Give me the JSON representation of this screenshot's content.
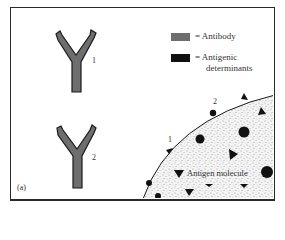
{
  "figure": {
    "panel_label": "(a)",
    "antibodies": [
      {
        "id": "antibody-1",
        "label": "1"
      },
      {
        "id": "antibody-2",
        "label": "2"
      }
    ],
    "legend": [
      {
        "swatch_color": "#6e6e6e",
        "text": "= Antibody"
      },
      {
        "swatch_color": "#111111",
        "text_line1": "= Antigenic",
        "text_line2": "determinants"
      }
    ],
    "antigen": {
      "label": "Antigen molecule",
      "site_labels": [
        "1",
        "2"
      ]
    },
    "colors": {
      "antibody_fill": "#6e6e6e",
      "antibody_stroke": "#1a1a1a",
      "determinant": "#111111",
      "frame": "#2a2a2a"
    }
  }
}
